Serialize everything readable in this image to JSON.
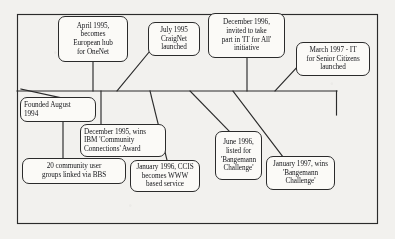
{
  "diagram": {
    "type": "horizontal-timeline",
    "frame": {
      "x": 17,
      "y": 14,
      "width": 361,
      "height": 210
    },
    "axis": {
      "y": 91,
      "x_start": 17,
      "x_end": 337,
      "end_tick_down_to": 115
    },
    "stroke_color": "#2b2b2b",
    "paper_color": "#f2f1ee",
    "box_fill": "#fbfaf7",
    "events": [
      {
        "id": "founded-1994",
        "position": "below-axis",
        "align": "left",
        "x": 20,
        "y": 97,
        "width": 76,
        "height": 25,
        "lines": [
          "Founded August",
          "1994"
        ],
        "text": "Founded August 1994"
      },
      {
        "id": "april-1995-onenet",
        "position": "above-axis",
        "align": "center",
        "x": 58,
        "y": 16,
        "width": 70,
        "height": 46,
        "lines": [
          "April 1995,",
          "becomes",
          "European hub",
          "for OneNet"
        ],
        "text": "April 1995, becomes European hub for OneNet"
      },
      {
        "id": "july-1995-craignet",
        "position": "above-axis",
        "align": "center",
        "x": 148,
        "y": 22,
        "width": 52,
        "height": 34,
        "lines": [
          "July 1995",
          "CraigNet",
          "launched"
        ],
        "text": "July 1995 CraigNet launched"
      },
      {
        "id": "december-1995-ibm-award",
        "position": "below-axis",
        "align": "left",
        "x": 80,
        "y": 124,
        "width": 86,
        "height": 33,
        "lines": [
          "December 1995, wins",
          "IBM 'Community",
          "Connections' Award"
        ],
        "text": "December 1995, wins IBM 'Community Connections' Award"
      },
      {
        "id": "twenty-community-user-groups",
        "position": "below-axis",
        "align": "center",
        "x": 22,
        "y": 158,
        "width": 104,
        "height": 26,
        "lines": [
          "20 community user",
          "groups linked via BBS"
        ],
        "text": "20 community user groups linked via BBS"
      },
      {
        "id": "january-1996-ccis-www",
        "position": "below-axis",
        "align": "center",
        "x": 130,
        "y": 160,
        "width": 70,
        "height": 32,
        "lines": [
          "January 1996, CCIS",
          "becomes WWW",
          "based service"
        ],
        "text": "January 1996, CCIS becomes WWW based service"
      },
      {
        "id": "june-1996-bangemann-listed",
        "position": "below-axis",
        "align": "center",
        "x": 215,
        "y": 131,
        "width": 47,
        "height": 49,
        "lines": [
          "June 1996,",
          "listed for",
          "'Bangemann",
          "Challenge'"
        ],
        "text": "June 1996, listed for 'Bangemann Challenge'"
      },
      {
        "id": "december-1996-it-for-all",
        "position": "above-axis",
        "align": "center",
        "x": 208,
        "y": 13,
        "width": 77,
        "height": 45,
        "lines": [
          "December 1996,",
          "invited to take",
          "part in 'IT for All'",
          "initiative"
        ],
        "text": "December 1996, invited to take part in 'IT for All' initiative"
      },
      {
        "id": "january-1997-bangemann-wins",
        "position": "below-axis",
        "align": "center",
        "x": 266,
        "y": 156,
        "width": 69,
        "height": 34,
        "lines": [
          "January 1997, wins",
          "'Bangemann",
          "Challenge'"
        ],
        "text": "January 1997, wins 'Bangemann Challenge'"
      },
      {
        "id": "march-1997-it-senior-citizens",
        "position": "above-axis",
        "align": "center",
        "x": 296,
        "y": 42,
        "width": 74,
        "height": 34,
        "lines": [
          "March 1997 - IT",
          "for Senior Citizens",
          "launched"
        ],
        "text": "March 1997 - IT for Senior Citizens launched"
      }
    ],
    "connectors": [
      {
        "from": "april-1995-onenet",
        "path": "M93,62 L93,91"
      },
      {
        "from": "july-1995-craignet",
        "path": "M150,50 L118,91"
      },
      {
        "from": "december-1996-it-for-all",
        "path": "M247,58 L247,91"
      },
      {
        "from": "march-1997-it-senior-citizens",
        "path": "M299,64 L276,91"
      },
      {
        "from": "founded-1994",
        "path": "M22,91 L60,97"
      },
      {
        "from": "december-1995-ibm-award",
        "path": "M101,91 L101,124"
      },
      {
        "from": "twenty-community-user-groups",
        "path": "M63,122 L63,158"
      },
      {
        "from": "january-1996-ccis-www",
        "path": "M152,91 L166,160"
      },
      {
        "from": "june-1996-bangemann-listed",
        "path": "M190,91 L228,131"
      },
      {
        "from": "january-1997-bangemann-wins",
        "path": "M232,91 L282,156"
      }
    ]
  }
}
